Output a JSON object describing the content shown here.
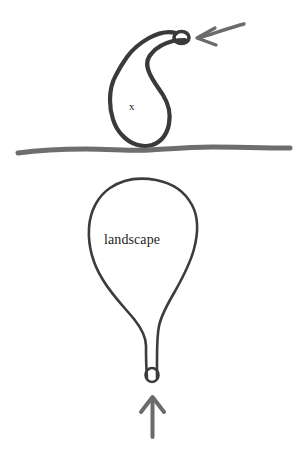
{
  "canvas": {
    "width": 304,
    "height": 475,
    "background_color": "#ffffff",
    "title": "hand-drawn diagram of two balloon shapes separated by a horizontal line"
  },
  "colors": {
    "ink_dark": "#333333",
    "ink_upper": "#3a3a3a",
    "ink_lower": "#3c3c3c",
    "divider_gray": "#6e6e6e",
    "arrow_gray": "#6b6b6b",
    "text": "#1d1d1d",
    "background": "#ffffff"
  },
  "labels": {
    "upper_shape": "x",
    "lower_shape": "landscape"
  },
  "elements": {
    "upper_balloon": {
      "name": "upper-balloon-shape",
      "label": "x",
      "description": "small teardrop balloon with curving neck ending in a tiny loop at upper right",
      "stroke_width": 4.2,
      "stroke_color": "#3a3a3a",
      "body_bounds": {
        "x": 112,
        "y": 72,
        "width": 52,
        "height": 74
      },
      "loop_center": {
        "x": 182,
        "y": 38
      }
    },
    "lower_balloon": {
      "name": "lower-balloon-shape",
      "label": "landscape",
      "description": "large rounded balloon tapering to a narrow neck with a tiny loop at the bottom",
      "stroke_width": 2.6,
      "stroke_color": "#3c3c3c",
      "body_bounds": {
        "x": 88,
        "y": 180,
        "width": 108,
        "height": 150
      },
      "loop_center": {
        "x": 152,
        "y": 375
      }
    },
    "divider_line": {
      "name": "horizontal-divider-line",
      "description": "slightly wavy hand-drawn gray horizontal rule",
      "stroke_width": 5,
      "stroke_color": "#6e6e6e",
      "x_start": 18,
      "x_end": 290,
      "y": 150
    },
    "top_arrow": {
      "name": "top-left-pointing-arrow",
      "direction": "left",
      "color": "#6b6b6b",
      "tail": {
        "x": 244,
        "y": 24
      },
      "tip": {
        "x": 197,
        "y": 38
      }
    },
    "bottom_arrow": {
      "name": "bottom-up-pointing-arrow",
      "direction": "up",
      "color": "#6b6b6b",
      "tail": {
        "x": 152,
        "y": 437
      },
      "tip": {
        "x": 152,
        "y": 397
      }
    }
  }
}
